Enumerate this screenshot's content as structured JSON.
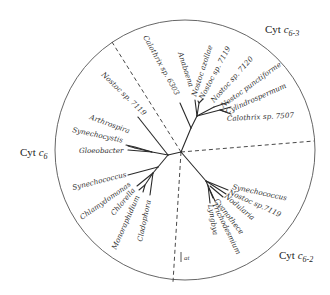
{
  "groups": {
    "c6": {
      "prefix": "Cyt ",
      "c": "c",
      "sub": "6"
    },
    "c63": {
      "prefix": "Cyt ",
      "c": "c",
      "sub": "6-3"
    },
    "c62": {
      "prefix": "Cyt ",
      "c": "c",
      "sub": "6-2"
    }
  },
  "taxa": {
    "calothrix6303": "Calothrix sp. 6303",
    "nostoc7119_a": "Nostoc sp. 7119",
    "arthrospira": "Arthrospira",
    "synechocystis": "Synechocystis",
    "gloeobacter": "Gloeobacter",
    "synechococcus_a": "Synechococcus",
    "chlamydomonas": "Chlamydomonas",
    "chlorella": "Chlorella",
    "monoraphidium": "Monoraphidium",
    "cladophora": "Cladophora",
    "anabaena": "Anabaena",
    "nostoc_azollae": "Nostoc azollae",
    "nostoc7119_b": "Nostoc sp. 7119",
    "nostoc7120": "Nostoc sp. 7120",
    "nostoc_punctiforme": "Nostoc punctiforme",
    "cylindrospermum": "Cylindrospermum",
    "calothrix7507": "Calothrix sp. 7507",
    "synechococcus_b": "Synechococcus",
    "nostoc7119_c": "Nostoc sp.7119",
    "nodularia": "Nodularia",
    "cyanothece": "Cyanothece",
    "trichodesmium": "Trichodesmium",
    "lyngbya": "Lyngbya"
  },
  "scale": {
    "label": "at"
  }
}
